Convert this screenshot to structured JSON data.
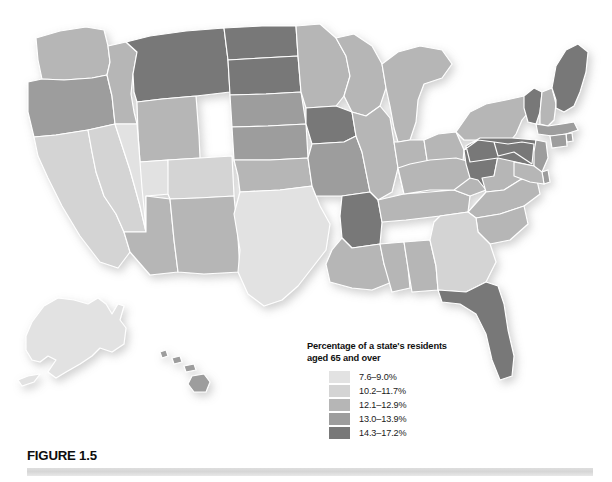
{
  "figure": {
    "caption_label": "FIGURE 1.5",
    "background_color": "#ffffff",
    "rule_color": "#d8d8d8"
  },
  "legend": {
    "title": "Percentage of a state's residents\naged 65 and over",
    "title_line1": "Percentage of a state's residents",
    "title_line2": "aged 65 and over",
    "entries": [
      {
        "label": "7.6–9.0%",
        "color": "#e2e2e2",
        "min": 7.6,
        "max": 9.0
      },
      {
        "label": "10.2–11.7%",
        "color": "#d4d4d4",
        "min": 10.2,
        "max": 11.7
      },
      {
        "label": "12.1–12.9%",
        "color": "#b6b6b6",
        "min": 12.1,
        "max": 12.9
      },
      {
        "label": "13.0–13.9%",
        "color": "#9d9d9d",
        "min": 13.0,
        "max": 13.9
      },
      {
        "label": "14.3–17.2%",
        "color": "#787878",
        "min": 14.3,
        "max": 17.2
      }
    ]
  },
  "chart_data": {
    "type": "map",
    "subtype": "choropleth",
    "title": "Percentage of a state's residents aged 65 and over",
    "region": "United States",
    "unit": "percent",
    "legend_position": "bottom-center-right",
    "classes": [
      {
        "label": "7.6–9.0%",
        "color": "#e2e2e2"
      },
      {
        "label": "10.2–11.7%",
        "color": "#d4d4d4"
      },
      {
        "label": "12.1–12.9%",
        "color": "#b6b6b6"
      },
      {
        "label": "13.0–13.9%",
        "color": "#9d9d9d"
      },
      {
        "label": "14.3–17.2%",
        "color": "#787878"
      }
    ],
    "states": [
      {
        "code": "AL",
        "name": "Alabama",
        "class": 3
      },
      {
        "code": "AK",
        "name": "Alaska",
        "class": 1
      },
      {
        "code": "AZ",
        "name": "Arizona",
        "class": 3
      },
      {
        "code": "AR",
        "name": "Arkansas",
        "class": 5
      },
      {
        "code": "CA",
        "name": "California",
        "class": 2
      },
      {
        "code": "CO",
        "name": "Colorado",
        "class": 2
      },
      {
        "code": "CT",
        "name": "Connecticut",
        "class": 4
      },
      {
        "code": "DE",
        "name": "Delaware",
        "class": 4
      },
      {
        "code": "FL",
        "name": "Florida",
        "class": 5
      },
      {
        "code": "GA",
        "name": "Georgia",
        "class": 2
      },
      {
        "code": "HI",
        "name": "Hawaii",
        "class": 4
      },
      {
        "code": "ID",
        "name": "Idaho",
        "class": 3
      },
      {
        "code": "IL",
        "name": "Illinois",
        "class": 3
      },
      {
        "code": "IN",
        "name": "Indiana",
        "class": 3
      },
      {
        "code": "IA",
        "name": "Iowa",
        "class": 5
      },
      {
        "code": "KS",
        "name": "Kansas",
        "class": 4
      },
      {
        "code": "KY",
        "name": "Kentucky",
        "class": 3
      },
      {
        "code": "LA",
        "name": "Louisiana",
        "class": 3
      },
      {
        "code": "ME",
        "name": "Maine",
        "class": 5
      },
      {
        "code": "MD",
        "name": "Maryland",
        "class": 3
      },
      {
        "code": "MA",
        "name": "Massachusetts",
        "class": 4
      },
      {
        "code": "MI",
        "name": "Michigan",
        "class": 3
      },
      {
        "code": "MN",
        "name": "Minnesota",
        "class": 3
      },
      {
        "code": "MS",
        "name": "Mississippi",
        "class": 3
      },
      {
        "code": "MO",
        "name": "Missouri",
        "class": 4
      },
      {
        "code": "MT",
        "name": "Montana",
        "class": 5
      },
      {
        "code": "NE",
        "name": "Nebraska",
        "class": 4
      },
      {
        "code": "NV",
        "name": "Nevada",
        "class": 2
      },
      {
        "code": "NH",
        "name": "New Hampshire",
        "class": 3
      },
      {
        "code": "NJ",
        "name": "New Jersey",
        "class": 4
      },
      {
        "code": "NM",
        "name": "New Mexico",
        "class": 3
      },
      {
        "code": "NY",
        "name": "New York",
        "class": 3
      },
      {
        "code": "NC",
        "name": "North Carolina",
        "class": 3
      },
      {
        "code": "ND",
        "name": "North Dakota",
        "class": 5
      },
      {
        "code": "OH",
        "name": "Ohio",
        "class": 3
      },
      {
        "code": "OK",
        "name": "Oklahoma",
        "class": 3
      },
      {
        "code": "OR",
        "name": "Oregon",
        "class": 4
      },
      {
        "code": "PA",
        "name": "Pennsylvania",
        "class": 5
      },
      {
        "code": "RI",
        "name": "Rhode Island",
        "class": 4
      },
      {
        "code": "SC",
        "name": "South Carolina",
        "class": 3
      },
      {
        "code": "SD",
        "name": "South Dakota",
        "class": 5
      },
      {
        "code": "TN",
        "name": "Tennessee",
        "class": 3
      },
      {
        "code": "TX",
        "name": "Texas",
        "class": 1
      },
      {
        "code": "UT",
        "name": "Utah",
        "class": 1
      },
      {
        "code": "VT",
        "name": "Vermont",
        "class": 5
      },
      {
        "code": "VA",
        "name": "Virginia",
        "class": 3
      },
      {
        "code": "WA",
        "name": "Washington",
        "class": 3
      },
      {
        "code": "WV",
        "name": "West Virginia",
        "class": 5
      },
      {
        "code": "WI",
        "name": "Wisconsin",
        "class": 3
      },
      {
        "code": "WY",
        "name": "Wyoming",
        "class": 3
      }
    ]
  }
}
